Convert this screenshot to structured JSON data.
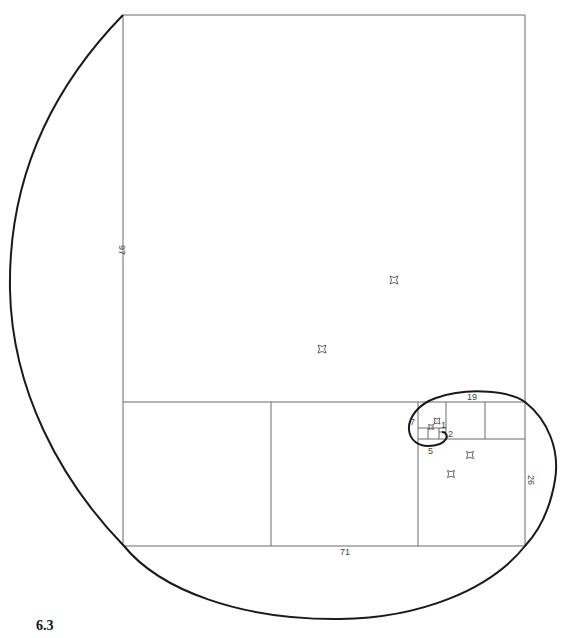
{
  "figure": {
    "caption": "6.3"
  },
  "labels": {
    "left_side": "97",
    "bottom": "71",
    "right_side": "26",
    "top_inner": "19",
    "inner_left": "7",
    "inner_bottom": "5",
    "inner_2": "2",
    "inner_1": "1"
  },
  "colors": {
    "spiral": "#1a1a1a",
    "grid": "#6a6a6a",
    "background": "#ffffff"
  }
}
